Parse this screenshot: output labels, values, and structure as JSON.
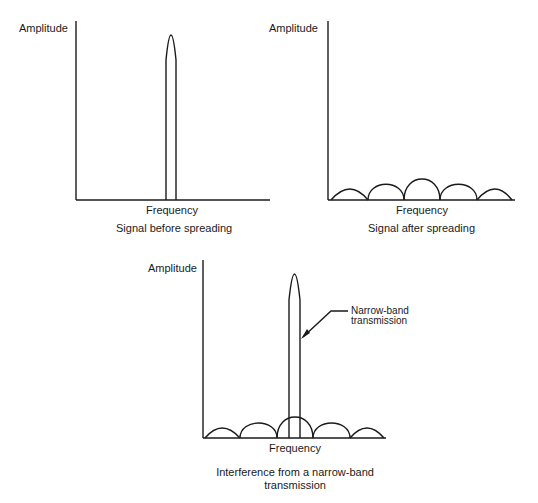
{
  "figures": [
    {
      "id": "before",
      "ylabel": "Amplitude",
      "xlabel": "Frequency",
      "caption": "Signal before spreading"
    },
    {
      "id": "after",
      "ylabel": "Amplitude",
      "xlabel": "Frequency",
      "caption": "Signal after spreading"
    },
    {
      "id": "interference",
      "ylabel": "Amplitude",
      "xlabel": "Frequency",
      "caption_line1": "Interference from a narrow-band",
      "caption_line2": "transmission",
      "annotation_line1": "Narrow-band",
      "annotation_line2": "transmission"
    }
  ],
  "colors": {
    "stroke": "#1a1a1a",
    "background": "#ffffff"
  }
}
